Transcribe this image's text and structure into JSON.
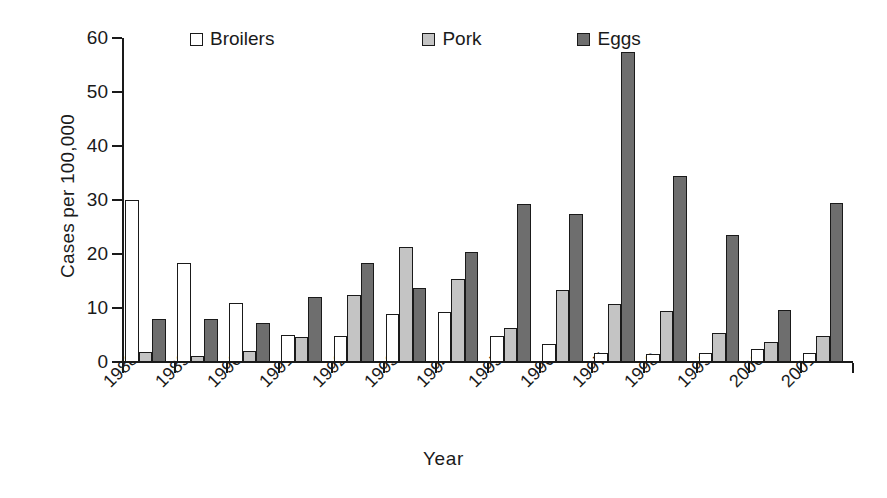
{
  "chart_data": {
    "type": "bar",
    "title": "",
    "xlabel": "Year",
    "ylabel": "Cases per 100,000",
    "ylim": [
      0,
      60
    ],
    "yticks": [
      0,
      10,
      20,
      30,
      40,
      50,
      60
    ],
    "grid": false,
    "legend_position": "top-center",
    "categories": [
      "1988",
      "1989",
      "1990",
      "1991",
      "1992",
      "1993",
      "1994",
      "1995",
      "1996",
      "1997",
      "1998",
      "1999",
      "2000",
      "2001"
    ],
    "series": [
      {
        "name": "Broilers",
        "color": "#ffffff",
        "values": [
          30.0,
          18.3,
          11.0,
          5.0,
          4.8,
          8.9,
          9.3,
          4.8,
          3.4,
          1.6,
          1.5,
          1.6,
          2.5,
          1.6
        ]
      },
      {
        "name": "Pork",
        "color": "#c4c4c4",
        "values": [
          1.8,
          1.2,
          2.0,
          4.6,
          12.4,
          21.3,
          15.4,
          6.3,
          13.4,
          10.8,
          9.4,
          5.4,
          3.7,
          4.8
        ]
      },
      {
        "name": "Eggs",
        "color": "#6e6e6e",
        "values": [
          8.0,
          8.0,
          7.2,
          12.1,
          18.3,
          13.7,
          20.3,
          29.3,
          27.5,
          57.4,
          34.5,
          23.6,
          9.6,
          29.5
        ]
      }
    ]
  },
  "legend": {
    "items": [
      {
        "label": "Broilers",
        "swatch": "legend-swatch-broilers"
      },
      {
        "label": "Pork",
        "swatch": "legend-swatch-pork"
      },
      {
        "label": "Eggs",
        "swatch": "legend-swatch-eggs"
      }
    ]
  },
  "axes": {
    "y_title": "Cases per 100,000",
    "x_title": "Year"
  }
}
